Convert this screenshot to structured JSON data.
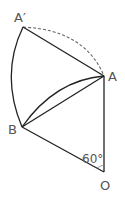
{
  "diagram": {
    "labels": {
      "a_prime": "A′",
      "a": "A",
      "b": "B",
      "o": "O",
      "angle": "60°"
    },
    "points": {
      "A_prime": [
        23,
        27
      ],
      "A": [
        104,
        76
      ],
      "B": [
        22,
        127
      ],
      "O": [
        104,
        172
      ]
    },
    "colors": {
      "stroke": "#222222",
      "dashed": "#666666",
      "label": "#555555"
    }
  }
}
